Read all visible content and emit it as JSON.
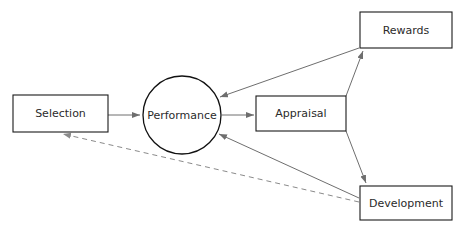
{
  "diagram": {
    "type": "flow-diagram",
    "background_color": "#ffffff",
    "node_border_color": "#1a1a1a",
    "edge_color": "#6e6e6e",
    "dashed_edge_color": "#8a8a8a",
    "text_color": "#2b2b2b",
    "nodes": [
      {
        "id": "selection",
        "label": "Selection",
        "shape": "rectangle",
        "x": 13,
        "y": 95,
        "width": 95,
        "height": 37
      },
      {
        "id": "performance",
        "label": "Performance",
        "shape": "circle",
        "cx": 182,
        "cy": 115,
        "r": 39
      },
      {
        "id": "appraisal",
        "label": "Appraisal",
        "shape": "rectangle",
        "x": 256,
        "y": 96,
        "width": 90,
        "height": 35
      },
      {
        "id": "rewards",
        "label": "Rewards",
        "shape": "rectangle",
        "x": 360,
        "y": 12,
        "width": 92,
        "height": 36
      },
      {
        "id": "development",
        "label": "Development",
        "shape": "rectangle",
        "x": 360,
        "y": 186,
        "width": 92,
        "height": 34
      }
    ],
    "edges": [
      {
        "id": "selection-to-performance",
        "from": "selection",
        "to": "performance",
        "style": "solid",
        "arrow": "end",
        "path": "M 108 115 L 140 115"
      },
      {
        "id": "performance-to-appraisal",
        "from": "performance",
        "to": "appraisal",
        "style": "solid",
        "arrow": "end",
        "path": "M 222 115 L 254 115"
      },
      {
        "id": "appraisal-to-rewards",
        "from": "appraisal",
        "to": "rewards",
        "style": "solid",
        "arrow": "end",
        "path": "M 346 96 L 363 51"
      },
      {
        "id": "appraisal-to-development",
        "from": "appraisal",
        "to": "development",
        "style": "solid",
        "arrow": "end",
        "path": "M 346 131 L 366 183"
      },
      {
        "id": "rewards-to-performance",
        "from": "rewards",
        "to": "performance",
        "style": "solid",
        "arrow": "end",
        "path": "M 359 48 L 220 97"
      },
      {
        "id": "development-to-performance",
        "from": "development",
        "to": "performance",
        "style": "solid",
        "arrow": "end",
        "path": "M 359 198 L 219 134"
      },
      {
        "id": "development-to-selection",
        "from": "development",
        "to": "selection",
        "style": "dashed",
        "arrow": "end",
        "path": "M 359 202 L 63 134"
      }
    ]
  }
}
